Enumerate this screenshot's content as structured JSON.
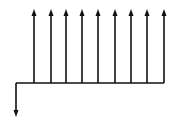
{
  "diagram": {
    "type": "cash-flow-diagram",
    "timeline": {
      "x_start": 16,
      "x_end": 164,
      "y": 83
    },
    "outflow": {
      "x": 16,
      "y_top": 83,
      "y_bottom": 117
    },
    "inflows": [
      {
        "x": 34
      },
      {
        "x": 51
      },
      {
        "x": 66
      },
      {
        "x": 82
      },
      {
        "x": 98
      },
      {
        "x": 115
      },
      {
        "x": 131
      },
      {
        "x": 147
      },
      {
        "x": 164
      }
    ],
    "inflow_top": 9,
    "color": "#111111"
  }
}
